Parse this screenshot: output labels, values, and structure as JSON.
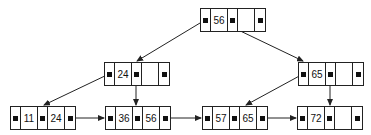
{
  "diagram": {
    "type": "B+ tree",
    "nodes": [
      {
        "id": "root",
        "keys": [
          "56",
          ""
        ],
        "pointers": [
          true,
          true,
          true
        ],
        "x": 200,
        "y": 8
      },
      {
        "id": "internal-left",
        "keys": [
          "24",
          ""
        ],
        "pointers": [
          true,
          true,
          true
        ],
        "x": 104,
        "y": 62
      },
      {
        "id": "internal-right",
        "keys": [
          "65",
          ""
        ],
        "pointers": [
          true,
          true,
          true
        ],
        "x": 298,
        "y": 62
      },
      {
        "id": "leaf-1",
        "keys": [
          "11",
          "24"
        ],
        "pointers": [
          true,
          true,
          true
        ],
        "x": 10,
        "y": 106
      },
      {
        "id": "leaf-2",
        "keys": [
          "36",
          "56"
        ],
        "pointers": [
          true,
          true,
          true
        ],
        "x": 105,
        "y": 106
      },
      {
        "id": "leaf-3",
        "keys": [
          "57",
          "65"
        ],
        "pointers": [
          true,
          true,
          true
        ],
        "x": 202,
        "y": 106
      },
      {
        "id": "leaf-4",
        "keys": [
          "72",
          ""
        ],
        "pointers": [
          true,
          true,
          true
        ],
        "x": 297,
        "y": 106
      }
    ],
    "edges": [
      {
        "from": "root",
        "to": "internal-left",
        "kind": "child"
      },
      {
        "from": "root",
        "to": "internal-right",
        "kind": "child"
      },
      {
        "from": "internal-left",
        "to": "leaf-1",
        "kind": "child"
      },
      {
        "from": "internal-left",
        "to": "leaf-2",
        "kind": "child"
      },
      {
        "from": "internal-right",
        "to": "leaf-3",
        "kind": "child"
      },
      {
        "from": "internal-right",
        "to": "leaf-4",
        "kind": "child"
      },
      {
        "from": "leaf-1",
        "to": "leaf-2",
        "kind": "sibling"
      },
      {
        "from": "leaf-2",
        "to": "leaf-3",
        "kind": "sibling"
      },
      {
        "from": "leaf-3",
        "to": "leaf-4",
        "kind": "sibling"
      }
    ],
    "colors": {
      "line": "#222222",
      "background": "#ffffff"
    }
  }
}
